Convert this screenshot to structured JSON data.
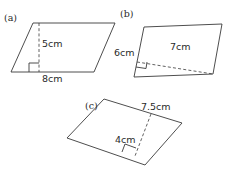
{
  "figures": [
    {
      "id": "a",
      "label": "(a)",
      "shape": "parallelogram",
      "dimensions": [
        {
          "name": "base",
          "text": "8cm"
        },
        {
          "name": "height",
          "text": "5cm"
        }
      ]
    },
    {
      "id": "b",
      "label": "(b)",
      "shape": "parallelogram",
      "dimensions": [
        {
          "name": "side",
          "text": "6cm"
        },
        {
          "name": "height",
          "text": "7cm"
        }
      ]
    },
    {
      "id": "c",
      "label": "(c)",
      "shape": "parallelogram",
      "dimensions": [
        {
          "name": "base",
          "text": "7.5cm"
        },
        {
          "name": "height",
          "text": "4cm"
        }
      ]
    }
  ]
}
